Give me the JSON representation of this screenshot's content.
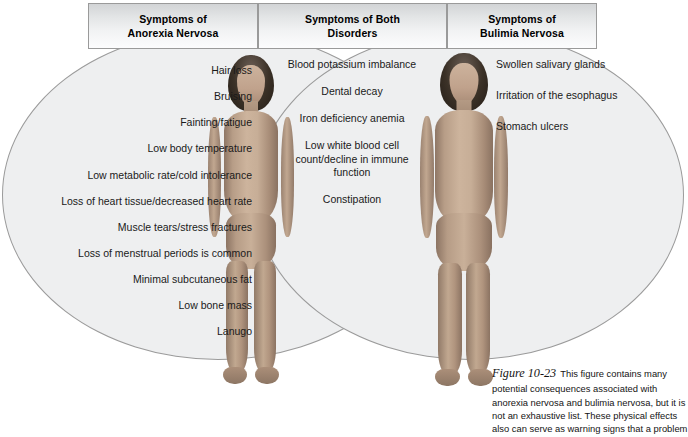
{
  "figure": {
    "caption_label": "Figure 10-23",
    "caption_text": "This figure contains many potential consequences associated with anorexia nervosa and bulimia nervosa, but it is not an exhaustive list. These physical effects also can serve as warning signs that a problem"
  },
  "colors": {
    "ellipse_fill": "#eeeff0",
    "ellipse_stroke": "#9b9b9b",
    "header_border": "#9a9a9a",
    "text": "#1a1a1a"
  },
  "headers": {
    "anorexia": "Symptoms of\nAnorexia Nervosa",
    "anorexia_line1": "Symptoms of",
    "anorexia_line2": "Anorexia Nervosa",
    "both_line1": "Symptoms of Both",
    "both_line2": "Disorders",
    "bulimia_line1": "Symptoms of",
    "bulimia_line2": "Bulimia Nervosa"
  },
  "anorexia_symptoms": [
    "Hair loss",
    "Bruising",
    "Fainting/fatigue",
    "Low body temperature",
    "Low metabolic rate/cold intolerance",
    "Loss of heart tissue/decreased heart rate",
    "Muscle tears/stress fractures",
    "Loss of menstrual periods is common",
    "Minimal subcutaneous fat",
    "Low bone mass",
    "Lanugo"
  ],
  "both_symptoms": [
    "Blood potassium imbalance",
    "Dental decay",
    "Iron deficiency anemia",
    "Low white blood cell count/decline in immune function",
    "Constipation"
  ],
  "bulimia_symptoms": [
    "Swollen salivary glands",
    "Irritation of the esophagus",
    "Stomach ulcers"
  ],
  "figures": {
    "anorexia_body_alt": "anorexia-nervosa-body-illustration",
    "bulimia_body_alt": "bulimia-nervosa-body-illustration"
  }
}
